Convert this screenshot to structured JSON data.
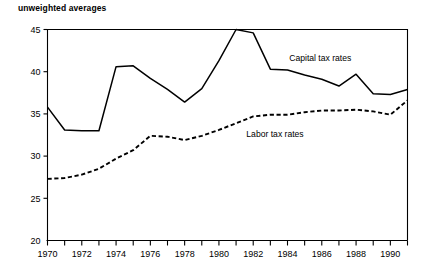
{
  "chart_data": {
    "type": "line",
    "title": "unweighted averages",
    "xlabel": "",
    "ylabel": "",
    "xlim": [
      1970,
      1991
    ],
    "ylim": [
      20,
      45
    ],
    "grid": false,
    "legend_position": "inline-annotations",
    "x": [
      1970,
      1971,
      1972,
      1973,
      1974,
      1975,
      1976,
      1977,
      1978,
      1979,
      1980,
      1981,
      1982,
      1983,
      1984,
      1985,
      1986,
      1987,
      1988,
      1989,
      1990,
      1991
    ],
    "xtick_values": [
      1970,
      1971,
      1972,
      1973,
      1974,
      1975,
      1976,
      1977,
      1978,
      1979,
      1980,
      1981,
      1982,
      1983,
      1984,
      1985,
      1986,
      1987,
      1988,
      1989,
      1990,
      1991
    ],
    "xtick_labels": [
      "1970",
      "",
      "1972",
      "",
      "1974",
      "",
      "1976",
      "",
      "1978",
      "",
      "1980",
      "",
      "1982",
      "",
      "1984",
      "",
      "1986",
      "",
      "1988",
      "",
      "1990",
      ""
    ],
    "ytick_values": [
      20,
      25,
      30,
      35,
      40,
      45
    ],
    "ytick_labels": [
      "20",
      "25",
      "30",
      "35",
      "40",
      "45"
    ],
    "series": [
      {
        "name": "Capital tax rates",
        "style": "solid",
        "color": "#000000",
        "label_x": 1984.1,
        "label_y": 41.3,
        "values": [
          35.8,
          33.1,
          33.0,
          33.0,
          40.6,
          40.7,
          39.2,
          37.9,
          36.4,
          38.0,
          41.3,
          45.0,
          44.6,
          40.3,
          40.2,
          39.6,
          39.1,
          38.3,
          39.7,
          37.4,
          37.3,
          37.9
        ]
      },
      {
        "name": "Labor tax rates",
        "style": "dashed",
        "color": "#000000",
        "label_x": 1981.6,
        "label_y": 32.3,
        "values": [
          27.3,
          27.4,
          27.8,
          28.5,
          29.7,
          30.7,
          32.4,
          32.3,
          31.9,
          32.4,
          33.1,
          33.9,
          34.7,
          34.9,
          34.9,
          35.2,
          35.4,
          35.4,
          35.5,
          35.3,
          34.9,
          36.6
        ]
      }
    ]
  }
}
